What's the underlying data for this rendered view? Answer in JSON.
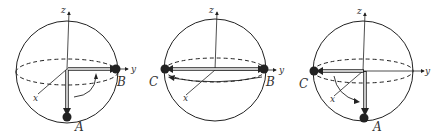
{
  "figure": {
    "panels": [
      {
        "id": "panel-1",
        "axis_labels": {
          "x": "x",
          "y": "y",
          "z": "z"
        },
        "points": [
          {
            "label": "B",
            "position": "+y"
          },
          {
            "label": "A",
            "position": "-z"
          }
        ],
        "description": "Vector rotates from B (+y) down to A (-z) about x axis"
      },
      {
        "id": "panel-2",
        "axis_labels": {
          "x": "x",
          "y": "y",
          "z": "z"
        },
        "points": [
          {
            "label": "C",
            "position": "-y"
          },
          {
            "label": "B",
            "position": "+y"
          }
        ],
        "description": "Vector from B to C along equator, rotation around z"
      },
      {
        "id": "panel-3",
        "axis_labels": {
          "x": "x",
          "y": "y",
          "z": "z"
        },
        "points": [
          {
            "label": "C",
            "position": "-y"
          },
          {
            "label": "A",
            "position": "-z"
          }
        ],
        "description": "Vector rotates from C (-y) down to A (-z)"
      }
    ],
    "colors": {
      "stroke": "#222222",
      "point": "#222222",
      "label": "#333333"
    }
  }
}
